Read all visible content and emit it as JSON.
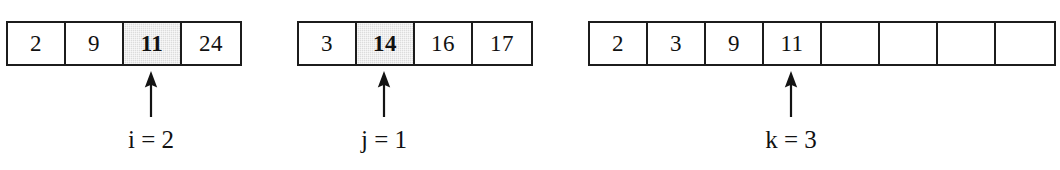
{
  "figure": {
    "colors": {
      "border": "#1c1c1c",
      "shaded_cell": "#dcdcdc",
      "background": "#ffffff",
      "text": "#111111"
    }
  },
  "arrays": [
    {
      "name": "left-subarray",
      "left": 6,
      "cell_width": 58,
      "cells": [
        {
          "value": "2",
          "shaded": false,
          "bold": false
        },
        {
          "value": "9",
          "shaded": false,
          "bold": false
        },
        {
          "value": "11",
          "shaded": true,
          "bold": true
        },
        {
          "value": "24",
          "shaded": false,
          "bold": false
        }
      ],
      "pointer": {
        "icon": "up-arrow-icon",
        "cell_index": 2,
        "x": 151,
        "label": "i = 2",
        "variable": "i",
        "value": "2"
      }
    },
    {
      "name": "right-subarray",
      "left": 297,
      "cell_width": 58,
      "cells": [
        {
          "value": "3",
          "shaded": false,
          "bold": false
        },
        {
          "value": "14",
          "shaded": true,
          "bold": true
        },
        {
          "value": "16",
          "shaded": false,
          "bold": false
        },
        {
          "value": "17",
          "shaded": false,
          "bold": false
        }
      ],
      "pointer": {
        "icon": "up-arrow-icon",
        "cell_index": 1,
        "x": 384,
        "label": "j = 1",
        "variable": "j",
        "value": "1"
      }
    },
    {
      "name": "merged-output-array",
      "left": 588,
      "cell_width": 58,
      "cells": [
        {
          "value": "2",
          "shaded": false,
          "bold": false
        },
        {
          "value": "3",
          "shaded": false,
          "bold": false
        },
        {
          "value": "9",
          "shaded": false,
          "bold": false
        },
        {
          "value": "11",
          "shaded": false,
          "bold": false
        },
        {
          "value": "",
          "shaded": false,
          "bold": false
        },
        {
          "value": "",
          "shaded": false,
          "bold": false
        },
        {
          "value": "",
          "shaded": false,
          "bold": false
        },
        {
          "value": "",
          "shaded": false,
          "bold": false
        }
      ],
      "pointer": {
        "icon": "up-arrow-icon",
        "cell_index": 3,
        "x": 791,
        "label": "k = 3",
        "variable": "k",
        "value": "3"
      }
    }
  ]
}
